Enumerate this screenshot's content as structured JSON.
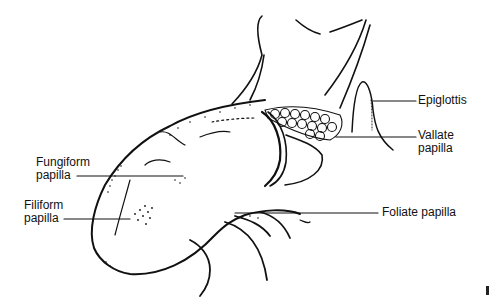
{
  "figure": {
    "labels": {
      "epiglottis": {
        "line1": "Epiglottis"
      },
      "vallate": {
        "line1": "Vallate",
        "line2": "papilla"
      },
      "fungiform": {
        "line1": "Fungiform",
        "line2": "papilla"
      },
      "filiform": {
        "line1": "Filiform",
        "line2": "papilla"
      },
      "foliate": {
        "line1": "Foliate papilla"
      }
    },
    "colors": {
      "ink": "#111111",
      "background": "#ffffff"
    }
  }
}
